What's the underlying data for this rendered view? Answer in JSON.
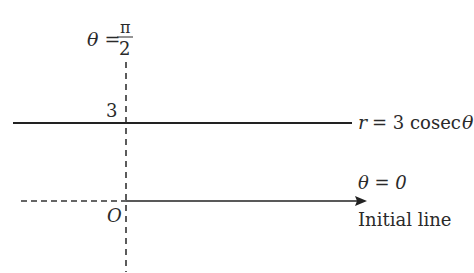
{
  "diagram": {
    "labels": {
      "theta_half_pi_lhs": "θ =",
      "theta_half_pi_num": "π",
      "theta_half_pi_den": "2",
      "intercept": "3",
      "curve_r": "r",
      "curve_eq": "= 3 cosec",
      "curve_theta": "θ",
      "theta_zero": "θ = 0",
      "origin": "O",
      "initial_line": "Initial line"
    },
    "colors": {
      "line": "#222222",
      "dashed": "#333333",
      "text": "#2a2a2a",
      "background": "#ffffff"
    }
  }
}
